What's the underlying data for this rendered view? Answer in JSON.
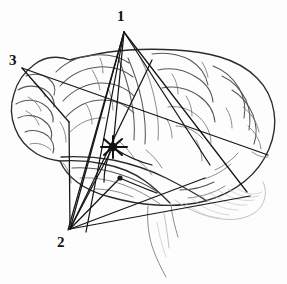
{
  "figure": {
    "background_color": "#fdfdfd",
    "ink_color": "#1a1a1a",
    "gyri_color": "#4a4a4a",
    "faint_color": "#9a9a9a",
    "width": 287,
    "height": 284
  },
  "labels": [
    {
      "id": "1",
      "text": "1",
      "x": 117,
      "y": 9,
      "anchor_x": 124,
      "anchor_y": 32
    },
    {
      "id": "2",
      "text": "2",
      "x": 57,
      "y": 235,
      "anchor_x": 70,
      "anchor_y": 229
    },
    {
      "id": "3",
      "text": "3",
      "x": 9,
      "y": 53,
      "anchor_x": 22,
      "anchor_y": 68
    }
  ],
  "nodes": {
    "point1": {
      "x": 124,
      "y": 32
    },
    "point2": {
      "x": 70,
      "y": 229
    },
    "point3": {
      "x": 22,
      "y": 68
    },
    "cortex_focus": {
      "x": 113,
      "y": 147
    },
    "secondary_focus": {
      "x": 120,
      "y": 178
    }
  },
  "projection_lines": [
    {
      "from": "point1",
      "to_x": 68,
      "to_y": 230
    },
    {
      "from": "point1",
      "to_x": 86,
      "to_y": 232
    },
    {
      "from": "point1",
      "to_x": 113,
      "to_y": 147
    },
    {
      "from": "point1",
      "to_x": 210,
      "to_y": 165
    },
    {
      "from": "point1",
      "to_x": 247,
      "to_y": 192
    },
    {
      "from": "point3",
      "to_x": 268,
      "to_y": 155
    },
    {
      "from": "point3",
      "to_x": 69,
      "to_y": 122
    },
    {
      "from": "point2",
      "to_x": 69,
      "to_y": 122
    },
    {
      "from": "point2",
      "to_x": 124,
      "to_y": 32
    },
    {
      "from": "point2",
      "to_x": 152,
      "to_y": 60
    },
    {
      "from": "point2",
      "to_x": 113,
      "to_y": 147
    },
    {
      "from": "point2",
      "to_x": 120,
      "to_y": 178
    },
    {
      "from": "point2",
      "to_x": 250,
      "to_y": 196
    },
    {
      "from": "point2",
      "to_x": 205,
      "to_y": 178
    }
  ],
  "anatomy": {
    "regions": [
      "frontal-lobe",
      "parietal-lobe",
      "occipital-lobe",
      "temporal-lobe",
      "cerebellum",
      "brainstem"
    ]
  }
}
